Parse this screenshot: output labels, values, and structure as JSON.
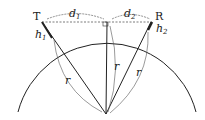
{
  "labels": {
    "transmitter": "T",
    "receiver": "R",
    "d1": "d",
    "d1_sub": "1",
    "d2": "d",
    "d2_sub": "2",
    "h1": "h",
    "h1_sub": "1",
    "h2": "h",
    "h2_sub": "2",
    "radius_left": "r",
    "radius_center": "r",
    "radius_right": "r"
  }
}
